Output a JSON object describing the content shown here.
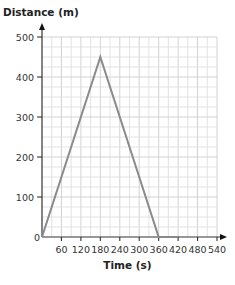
{
  "chart_data": {
    "type": "line",
    "title": "",
    "xlabel": "Time (s)",
    "ylabel": "Distance (m)",
    "xlim": [
      0,
      540
    ],
    "ylim": [
      0,
      500
    ],
    "x_ticks": [
      60,
      120,
      180,
      240,
      300,
      360,
      420,
      480,
      540
    ],
    "y_ticks": [
      100,
      200,
      300,
      400,
      500
    ],
    "origin_label": "0",
    "grid": true,
    "grid_minor_x": 30,
    "grid_minor_y": 25,
    "legend": null,
    "series": [
      {
        "name": "Distance",
        "x": [
          0,
          180,
          360,
          420
        ],
        "y": [
          0,
          450,
          0,
          0
        ],
        "color": "#8a8a8a"
      }
    ]
  },
  "colors": {
    "axis": "#333333",
    "grid_minor": "#dcdcdc",
    "grid_major": "#c8c8c8",
    "line": "#8a8a8a",
    "text": "#333333"
  }
}
